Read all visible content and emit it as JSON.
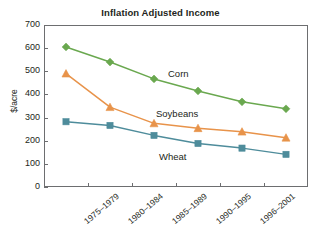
{
  "chart_data": {
    "type": "line",
    "title": "Inflation Adjusted Income",
    "xlabel": "",
    "ylabel": "$/acre",
    "ylim": [
      0,
      700
    ],
    "yticks": [
      0,
      100,
      200,
      300,
      400,
      500,
      600,
      700
    ],
    "grid": false,
    "legend_position": "inline-annotations",
    "categories": [
      "1975–1979",
      "1980–1984",
      "1985–1989",
      "1990–1995",
      "1996–2001",
      ""
    ],
    "series": [
      {
        "name": "Corn",
        "color": "#6aa84f",
        "marker": "diamond",
        "values": [
          605,
          540,
          467,
          415,
          368,
          338
        ]
      },
      {
        "name": "Soybeans",
        "color": "#e8934a",
        "marker": "triangle",
        "values": [
          490,
          345,
          275,
          254,
          239,
          213
        ]
      },
      {
        "name": "Wheat",
        "color": "#4e8c9b",
        "marker": "square",
        "values": [
          282,
          266,
          223,
          188,
          168,
          141
        ]
      }
    ]
  },
  "axis": {
    "frame_color": "#6d6e70"
  }
}
